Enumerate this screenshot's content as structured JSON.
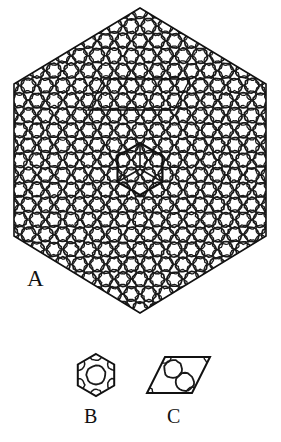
{
  "figure": {
    "background_color": "#ffffff",
    "ink_color": "#1a1a1a",
    "width": 281,
    "height": 442
  },
  "panels": [
    {
      "id": "A",
      "label": "A",
      "description": "Large hexagonal aggregate of circles arranged on a hexagonal lattice",
      "outline_shape": "hexagon",
      "center": {
        "x": 140,
        "y": 160
      },
      "vertices": [
        {
          "x": 140,
          "y": 8
        },
        {
          "x": 266,
          "y": 84
        },
        {
          "x": 266,
          "y": 236
        },
        {
          "x": 140,
          "y": 313
        },
        {
          "x": 14,
          "y": 236
        },
        {
          "x": 14,
          "y": 84
        }
      ],
      "lattice": {
        "type": "hexagonal",
        "spacing": 17.2,
        "large_circle_radius": 7.3,
        "small_circle_radius": 4.6,
        "rows": 19,
        "circle_count": 214
      },
      "overlays": [
        {
          "name": "rhombic-unit-cell-overlay",
          "shape": "rhombus",
          "vertices": [
            {
              "x": 104,
              "y": 79
            },
            {
              "x": 190,
              "y": 79
            },
            {
              "x": 174,
              "y": 110
            },
            {
              "x": 88,
              "y": 110
            }
          ],
          "stroke_width": 1.3
        },
        {
          "name": "hexagonal-unit-cell-overlay",
          "shape": "hexagon",
          "center": {
            "x": 140,
            "y": 169
          },
          "radius": 26,
          "stroke_width": 2.1
        }
      ]
    },
    {
      "id": "B",
      "label": "B",
      "description": "Hexagonal unit cell containing one central circle and six corner circle segments",
      "outline_shape": "hexagon",
      "center": {
        "x": 96,
        "y": 375
      },
      "radius": 21,
      "inner_circles": [
        {
          "x": 96,
          "y": 375,
          "r": 9.5,
          "kind": "full"
        },
        {
          "x": 96,
          "y": 354,
          "r": 6.5,
          "kind": "corner"
        },
        {
          "x": 114,
          "y": 364,
          "r": 6.5,
          "kind": "corner"
        },
        {
          "x": 114,
          "y": 385,
          "r": 6.5,
          "kind": "corner"
        },
        {
          "x": 96,
          "y": 396,
          "r": 6.5,
          "kind": "corner"
        },
        {
          "x": 78,
          "y": 385,
          "r": 6.5,
          "kind": "corner"
        },
        {
          "x": 78,
          "y": 364,
          "r": 6.5,
          "kind": "corner"
        }
      ]
    },
    {
      "id": "C",
      "label": "C",
      "description": "Rhombic unit cell containing two circles",
      "outline_shape": "rhombus",
      "vertices": [
        {
          "x": 165,
          "y": 357
        },
        {
          "x": 210,
          "y": 357
        },
        {
          "x": 192,
          "y": 393
        },
        {
          "x": 147,
          "y": 393
        }
      ],
      "inner_circles": [
        {
          "x": 173,
          "y": 369,
          "r": 9,
          "kind": "full"
        },
        {
          "x": 185,
          "y": 382,
          "r": 9,
          "kind": "full"
        },
        {
          "x": 165,
          "y": 357,
          "r": 6,
          "kind": "corner"
        },
        {
          "x": 210,
          "y": 357,
          "r": 6,
          "kind": "corner"
        },
        {
          "x": 192,
          "y": 393,
          "r": 6,
          "kind": "corner"
        },
        {
          "x": 147,
          "y": 393,
          "r": 6,
          "kind": "corner"
        }
      ]
    }
  ],
  "labels": {
    "a": "A",
    "b": "B",
    "c": "C"
  }
}
